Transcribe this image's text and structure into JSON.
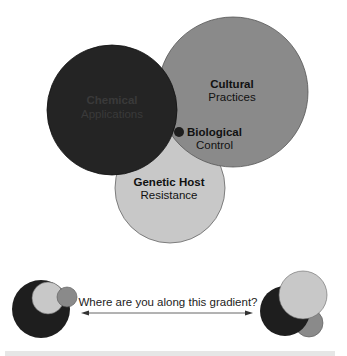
{
  "colors": {
    "chemical": "#242424",
    "cultural": "#8a8a8a",
    "genetic": "#c8c8c8",
    "biological": "#1e1e1e",
    "outline": "#555555",
    "text": "#111111",
    "chemical_text": "#3a3a3a",
    "arrow": "#555555"
  },
  "main_diagram": {
    "chemical": {
      "title": "Chemical",
      "subtitle": "Applications"
    },
    "cultural": {
      "title": "Cultural",
      "subtitle": "Practices"
    },
    "biological": {
      "title": "Biological",
      "subtitle": "Control"
    },
    "genetic": {
      "title": "Genetic Host",
      "subtitle": "Resistance"
    }
  },
  "gradient": {
    "question": "Where are you along this gradient?",
    "arrow": "double-headed-arrow"
  }
}
